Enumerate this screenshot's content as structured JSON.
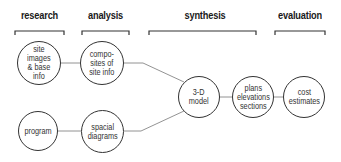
{
  "phases": [
    {
      "label": "research"
    },
    {
      "label": "analysis"
    },
    {
      "label": "synthesis"
    },
    {
      "label": "evaluation"
    }
  ],
  "nodes": [
    {
      "id": "site-images",
      "label": "site\nimages\n& base\ninfo"
    },
    {
      "id": "composites",
      "label": "compo-\nsites of\nsite info"
    },
    {
      "id": "program",
      "label": "program"
    },
    {
      "id": "spacial-diagrams",
      "label": "spacial\ndiagrams"
    },
    {
      "id": "3d-model",
      "label": "3-D\nmodel"
    },
    {
      "id": "plans",
      "label": "plans\nelevations\nsections"
    },
    {
      "id": "cost-estimates",
      "label": "cost\nestimates"
    }
  ],
  "colors": {
    "line": "#555555",
    "text": "#1a1a1a",
    "background": "#ffffff"
  }
}
